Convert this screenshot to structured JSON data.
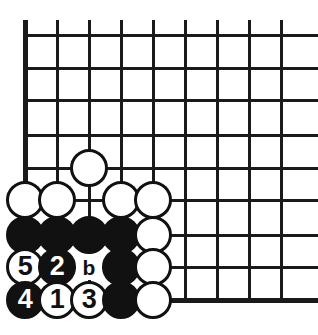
{
  "figure": {
    "name": "go-board-corner-diagram",
    "type": "go-board-diagram",
    "width": 318,
    "height": 335,
    "background_color": "#ffffff",
    "line_color": "#1a1a1a"
  },
  "board": {
    "origin_x": 25,
    "origin_y": 35,
    "spacing_x": 32,
    "spacing_y": 33,
    "columns": 9,
    "rows": 9,
    "vertical_line_x": [
      25,
      57,
      89,
      121,
      153,
      185,
      217,
      249,
      281
    ],
    "horizontal_line_y": [
      35,
      68,
      100,
      135,
      168,
      200,
      235,
      267,
      300
    ],
    "left_edge_thick": true,
    "bottom_edge_thick": true,
    "top_open": true,
    "right_open": true,
    "stone_diameter": 38
  },
  "stones": [
    {
      "id": "w-c2r4",
      "color": "white",
      "col": 2,
      "row": 4,
      "label": ""
    },
    {
      "id": "w-c0r5",
      "color": "white",
      "col": 0,
      "row": 5,
      "label": ""
    },
    {
      "id": "w-c1r5",
      "color": "white",
      "col": 1,
      "row": 5,
      "label": ""
    },
    {
      "id": "w-c3r5",
      "color": "white",
      "col": 3,
      "row": 5,
      "label": ""
    },
    {
      "id": "w-c4r5",
      "color": "white",
      "col": 4,
      "row": 5,
      "label": ""
    },
    {
      "id": "b-c0r6",
      "color": "black",
      "col": 0,
      "row": 6,
      "label": ""
    },
    {
      "id": "b-c1r6",
      "color": "black",
      "col": 1,
      "row": 6,
      "label": ""
    },
    {
      "id": "b-c2r6",
      "color": "black",
      "col": 2,
      "row": 6,
      "label": ""
    },
    {
      "id": "b-c3r6",
      "color": "black",
      "col": 3,
      "row": 6,
      "label": ""
    },
    {
      "id": "w-c4r6",
      "color": "white",
      "col": 4,
      "row": 6,
      "label": ""
    },
    {
      "id": "w-c0r7",
      "color": "white",
      "col": 0,
      "row": 7,
      "label": "5"
    },
    {
      "id": "b-c1r7",
      "color": "black",
      "col": 1,
      "row": 7,
      "label": "2"
    },
    {
      "id": "b-c3r7",
      "color": "black",
      "col": 3,
      "row": 7,
      "label": ""
    },
    {
      "id": "w-c4r7",
      "color": "white",
      "col": 4,
      "row": 7,
      "label": ""
    },
    {
      "id": "b-c0r8",
      "color": "black",
      "col": 0,
      "row": 8,
      "label": "4"
    },
    {
      "id": "w-c1r8",
      "color": "white",
      "col": 1,
      "row": 8,
      "label": "1"
    },
    {
      "id": "w-c2r8",
      "color": "white",
      "col": 2,
      "row": 8,
      "label": "3"
    },
    {
      "id": "b-c3r8",
      "color": "black",
      "col": 3,
      "row": 8,
      "label": ""
    },
    {
      "id": "w-c4r8",
      "color": "white",
      "col": 4,
      "row": 8,
      "label": ""
    }
  ],
  "point_labels": [
    {
      "id": "label-b",
      "text": "b",
      "col": 2,
      "row": 7
    }
  ],
  "move_sequence": [
    {
      "number": "1",
      "color": "white",
      "col": 1,
      "row": 8
    },
    {
      "number": "2",
      "color": "black",
      "col": 1,
      "row": 7
    },
    {
      "number": "3",
      "color": "white",
      "col": 2,
      "row": 8
    },
    {
      "number": "4",
      "color": "black",
      "col": 0,
      "row": 8
    },
    {
      "number": "5",
      "color": "white",
      "col": 0,
      "row": 7
    }
  ]
}
